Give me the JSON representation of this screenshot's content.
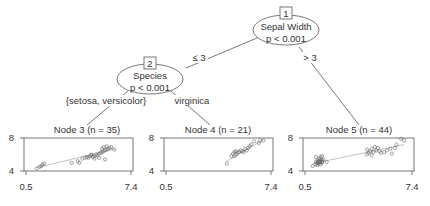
{
  "tree": {
    "root": {
      "id_label": "1",
      "variable": "Sepal Width",
      "pvalue": "p < 0.001",
      "edges": [
        {
          "label": "≤ 3",
          "to": "2"
        },
        {
          "label": "> 3",
          "to": "5"
        }
      ]
    },
    "inner": {
      "id_label": "2",
      "variable": "Species",
      "pvalue": "p < 0.001",
      "edges": [
        {
          "label": "{setosa, versicolor}",
          "to": "3"
        },
        {
          "label": "virginica",
          "to": "4"
        }
      ]
    },
    "leaves": [
      {
        "title": "Node 3 (n = 35)",
        "y_ticks": [
          "8",
          "4"
        ],
        "x_ticks": [
          "0.5",
          "7.4"
        ]
      },
      {
        "title": "Node 4 (n = 21)",
        "y_ticks": [
          "8",
          "4"
        ],
        "x_ticks": [
          "0.5",
          "7.4"
        ]
      },
      {
        "title": "Node 5 (n = 44)",
        "y_ticks": [
          "8",
          "4"
        ],
        "x_ticks": [
          "0.5",
          "7.4"
        ]
      }
    ]
  },
  "colors": {
    "line": "#555555",
    "point": "#666666",
    "fit": "#999999"
  },
  "chart_data": [
    {
      "type": "scatter",
      "title": "Node 3 (n = 35)",
      "xlim": [
        0.5,
        7.4
      ],
      "ylim": [
        4,
        8
      ],
      "x_ticks": [
        0.5,
        7.4
      ],
      "y_ticks": [
        4,
        8
      ],
      "grid": false,
      "points": [
        [
          1.2,
          4.3
        ],
        [
          1.4,
          4.5
        ],
        [
          1.5,
          4.6
        ],
        [
          1.6,
          4.8
        ],
        [
          1.7,
          4.9
        ],
        [
          3.5,
          5.0
        ],
        [
          3.9,
          5.2
        ],
        [
          4.0,
          5.0
        ],
        [
          4.2,
          5.5
        ],
        [
          4.4,
          5.6
        ],
        [
          4.5,
          5.7
        ],
        [
          4.6,
          5.6
        ],
        [
          4.7,
          5.8
        ],
        [
          4.8,
          5.9
        ],
        [
          4.9,
          5.7
        ],
        [
          5.0,
          5.8
        ],
        [
          5.1,
          6.0
        ],
        [
          5.2,
          5.9
        ],
        [
          5.3,
          6.1
        ],
        [
          5.4,
          6.2
        ],
        [
          5.5,
          6.3
        ],
        [
          5.6,
          6.4
        ],
        [
          5.7,
          6.5
        ],
        [
          5.8,
          6.6
        ],
        [
          5.9,
          6.7
        ],
        [
          6.0,
          6.8
        ],
        [
          5.5,
          6.7
        ],
        [
          5.6,
          6.9
        ],
        [
          5.8,
          7.0
        ],
        [
          6.1,
          6.9
        ],
        [
          6.3,
          6.6
        ],
        [
          5.0,
          5.5
        ],
        [
          4.8,
          6.0
        ],
        [
          5.3,
          5.6
        ],
        [
          5.7,
          5.4
        ]
      ],
      "fit_line": [
        [
          1.2,
          4.4
        ],
        [
          6.4,
          6.7
        ]
      ]
    },
    {
      "type": "scatter",
      "title": "Node 4 (n = 21)",
      "xlim": [
        0.5,
        7.4
      ],
      "ylim": [
        4,
        8
      ],
      "x_ticks": [
        0.5,
        7.4
      ],
      "y_ticks": [
        4,
        8
      ],
      "grid": false,
      "points": [
        [
          4.5,
          4.9
        ],
        [
          4.8,
          5.8
        ],
        [
          4.9,
          6.1
        ],
        [
          5.0,
          6.3
        ],
        [
          5.0,
          5.8
        ],
        [
          5.1,
          6.0
        ],
        [
          5.1,
          6.4
        ],
        [
          5.2,
          6.2
        ],
        [
          5.3,
          6.3
        ],
        [
          5.4,
          6.5
        ],
        [
          5.5,
          6.4
        ],
        [
          5.6,
          6.3
        ],
        [
          5.7,
          6.7
        ],
        [
          5.8,
          6.5
        ],
        [
          5.9,
          6.8
        ],
        [
          6.0,
          7.0
        ],
        [
          6.1,
          7.2
        ],
        [
          6.3,
          7.6
        ],
        [
          6.6,
          7.4
        ],
        [
          6.7,
          7.7
        ],
        [
          6.9,
          7.7
        ]
      ],
      "fit_line": [
        [
          4.5,
          5.2
        ],
        [
          6.9,
          7.8
        ]
      ]
    },
    {
      "type": "scatter",
      "title": "Node 5 (n = 44)",
      "xlim": [
        0.5,
        7.4
      ],
      "ylim": [
        4,
        8
      ],
      "x_ticks": [
        0.5,
        7.4
      ],
      "y_ticks": [
        4,
        8
      ],
      "grid": false,
      "points": [
        [
          1.0,
          4.6
        ],
        [
          1.2,
          4.8
        ],
        [
          1.3,
          5.0
        ],
        [
          1.4,
          5.1
        ],
        [
          1.4,
          4.9
        ],
        [
          1.5,
          5.2
        ],
        [
          1.5,
          5.4
        ],
        [
          1.6,
          5.0
        ],
        [
          1.3,
          5.3
        ],
        [
          1.4,
          5.5
        ],
        [
          1.5,
          5.7
        ],
        [
          1.6,
          5.8
        ],
        [
          1.2,
          5.7
        ],
        [
          1.4,
          5.2
        ],
        [
          1.7,
          5.4
        ],
        [
          1.3,
          4.7
        ],
        [
          1.6,
          5.1
        ],
        [
          1.5,
          4.8
        ],
        [
          1.9,
          5.1
        ],
        [
          1.4,
          5.0
        ],
        [
          1.5,
          5.1
        ],
        [
          1.6,
          5.3
        ],
        [
          1.3,
          5.0
        ],
        [
          1.2,
          5.1
        ],
        [
          4.5,
          6.0
        ],
        [
          4.6,
          6.2
        ],
        [
          4.7,
          6.4
        ],
        [
          4.8,
          6.7
        ],
        [
          4.9,
          6.3
        ],
        [
          5.0,
          6.9
        ],
        [
          5.1,
          6.5
        ],
        [
          4.5,
          6.6
        ],
        [
          5.2,
          6.8
        ],
        [
          4.8,
          5.9
        ],
        [
          5.3,
          6.4
        ],
        [
          5.4,
          6.2
        ],
        [
          5.6,
          6.3
        ],
        [
          5.8,
          6.5
        ],
        [
          6.0,
          6.7
        ],
        [
          6.3,
          6.8
        ],
        [
          6.1,
          6.1
        ],
        [
          6.4,
          7.2
        ],
        [
          6.7,
          7.9
        ],
        [
          6.9,
          7.7
        ]
      ],
      "fit_line": [
        [
          1.0,
          4.9
        ],
        [
          6.9,
          7.2
        ]
      ]
    }
  ]
}
